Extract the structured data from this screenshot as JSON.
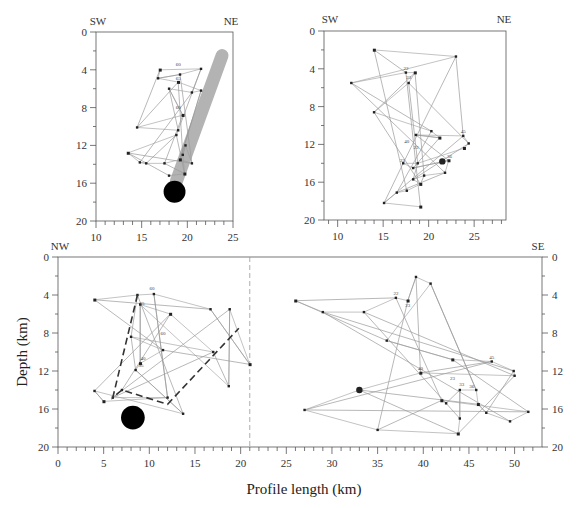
{
  "chart_data": [
    {
      "type": "scatter",
      "panel": "top-left",
      "title": "",
      "direction_labels": {
        "left": "SW",
        "right": "NE"
      },
      "xlim": [
        10,
        25
      ],
      "ylim": [
        20,
        0
      ],
      "xticks": [
        "10",
        "15",
        "20",
        "25"
      ],
      "yticks": [
        "0",
        "4",
        "8",
        "12",
        "16",
        "20"
      ],
      "annotations": [
        "60",
        "65",
        "60"
      ],
      "features": {
        "gray_band": {
          "from": [
            23.8,
            2.5
          ],
          "to": [
            18.8,
            15.8
          ],
          "color": "#b3b3b3"
        },
        "mainshock_circle": {
          "x": 18.6,
          "y": 16.9,
          "radius_km": 1.2,
          "color": "#000000"
        }
      },
      "events_approx": [
        [
          17,
          4
        ],
        [
          21.5,
          3.9
        ],
        [
          19.2,
          4.5
        ],
        [
          16.8,
          4.9
        ],
        [
          19,
          5.3
        ],
        [
          21.5,
          6.2
        ],
        [
          20.5,
          6.4
        ],
        [
          18,
          6
        ],
        [
          19.5,
          8.8
        ],
        [
          14.5,
          10.1
        ],
        [
          19,
          10.4
        ],
        [
          18.8,
          10.9
        ],
        [
          13.5,
          12.8
        ],
        [
          14.8,
          13.8
        ],
        [
          15.5,
          13.9
        ],
        [
          17.5,
          13.9
        ],
        [
          19.2,
          13.5
        ],
        [
          20.5,
          13.9
        ],
        [
          19.8,
          12
        ],
        [
          19.5,
          13
        ],
        [
          19.7,
          15
        ],
        [
          18,
          15.2
        ]
      ]
    },
    {
      "type": "scatter",
      "panel": "top-right",
      "title": "",
      "direction_labels": {
        "left": "SW",
        "right": "NE"
      },
      "xlim": [
        8.5,
        28.5
      ],
      "ylim": [
        20,
        0
      ],
      "xticks": [
        "10",
        "15",
        "20",
        "25"
      ],
      "yticks": [
        "0",
        "4",
        "8",
        "12",
        "16",
        "20"
      ],
      "annotations": [
        "22",
        "23",
        "45",
        "40",
        "23",
        "33",
        "36"
      ],
      "features": {
        "large_dot": {
          "x": 21.5,
          "y": 13.8
        }
      },
      "events_approx": [
        [
          14,
          2
        ],
        [
          23,
          2.7
        ],
        [
          11.5,
          5.5
        ],
        [
          17.5,
          4.4
        ],
        [
          18.5,
          4.4
        ],
        [
          17.8,
          5.5
        ],
        [
          14,
          8.6
        ],
        [
          20.3,
          10.6
        ],
        [
          21.2,
          11.3
        ],
        [
          18.6,
          11
        ],
        [
          23.8,
          11.1
        ],
        [
          24.4,
          11.9
        ],
        [
          23.9,
          12.4
        ],
        [
          18.8,
          14
        ],
        [
          17.2,
          14
        ],
        [
          18.3,
          14.5
        ],
        [
          22.2,
          13.7
        ],
        [
          21.8,
          15
        ],
        [
          19.5,
          15.3
        ],
        [
          18.3,
          15.7
        ],
        [
          19.1,
          16.2
        ],
        [
          17.6,
          16.9
        ],
        [
          16.5,
          17.1
        ],
        [
          15.1,
          18.2
        ],
        [
          19.1,
          18.6
        ]
      ]
    },
    {
      "type": "scatter",
      "panel": "bottom",
      "title": "",
      "xlabel": "Profile length (km)",
      "ylabel": "Depth (km)",
      "direction_labels": {
        "left": "NW",
        "right": "SE"
      },
      "xlim": [
        0,
        53
      ],
      "ylim": [
        20,
        0
      ],
      "xticks": [
        "0",
        "5",
        "10",
        "15",
        "20",
        "25",
        "30",
        "35",
        "40",
        "45",
        "50"
      ],
      "yticks_left": [
        "0",
        "4",
        "8",
        "12",
        "16",
        "20"
      ],
      "yticks_right": [
        "0",
        "4",
        "8",
        "12",
        "16",
        "20"
      ],
      "divider_x": 21,
      "annotations": [
        "60",
        "65",
        "60",
        "40",
        "35",
        "22",
        "23",
        "45",
        "40",
        "23",
        "33",
        "36"
      ],
      "features": {
        "dashed_outline": [
          [
            8.7,
            4
          ],
          [
            6,
            14.8
          ],
          [
            7,
            14
          ],
          [
            12,
            15.5
          ],
          [
            19.8,
            7.5
          ]
        ],
        "mainshock_circle": {
          "x": 8.2,
          "y": 16.9,
          "radius_km": 1.3,
          "color": "#000000"
        },
        "large_dot": {
          "x": 33,
          "y": 14
        }
      },
      "events_left_approx": [
        [
          4,
          4.5
        ],
        [
          8.7,
          4
        ],
        [
          10.5,
          3.9
        ],
        [
          16.7,
          5.5
        ],
        [
          21,
          11.3
        ],
        [
          18.8,
          5.5
        ],
        [
          18.7,
          13.6
        ],
        [
          9,
          5
        ],
        [
          12.3,
          6
        ],
        [
          17,
          10
        ],
        [
          8,
          8.4
        ],
        [
          11.5,
          9.8
        ],
        [
          9,
          11.2
        ],
        [
          8.5,
          11.9
        ],
        [
          13.7,
          16.5
        ],
        [
          4,
          14.1
        ],
        [
          5,
          15.2
        ],
        [
          12,
          14.8
        ],
        [
          6,
          14.8
        ],
        [
          7,
          14
        ]
      ],
      "events_right_approx": [
        [
          26,
          4.6
        ],
        [
          29,
          5.8
        ],
        [
          33.5,
          5.8
        ],
        [
          37,
          4.3
        ],
        [
          38.3,
          4.6
        ],
        [
          39.2,
          2.1
        ],
        [
          40.8,
          2.8
        ],
        [
          36,
          8.8
        ],
        [
          43.2,
          10.8
        ],
        [
          47.5,
          11
        ],
        [
          49.9,
          12
        ],
        [
          50,
          12.5
        ],
        [
          39.7,
          12.2
        ],
        [
          33,
          14
        ],
        [
          27,
          16.1
        ],
        [
          35,
          18.2
        ],
        [
          43.8,
          18.6
        ],
        [
          44,
          17
        ],
        [
          44,
          14
        ],
        [
          45.8,
          14
        ],
        [
          46,
          15.5
        ],
        [
          46.9,
          16.4
        ],
        [
          49.5,
          17.3
        ],
        [
          51.5,
          16.3
        ],
        [
          42,
          15.1
        ],
        [
          42.5,
          15.4
        ]
      ]
    }
  ],
  "figure": {
    "panels": {
      "top_left": {
        "left_label": "SW",
        "right_label": "NE"
      },
      "top_right": {
        "left_label": "SW",
        "right_label": "NE"
      },
      "bottom": {
        "left_label": "NW",
        "right_label": "SE"
      }
    },
    "axis_titles": {
      "y": "Depth (km)",
      "x": "Profile length (km)"
    },
    "colors": {
      "gray_band": "#b3b3b3",
      "event_line": "#9a9a9a",
      "dot": "#222222",
      "dashed": "#333333",
      "axis": "#555555"
    }
  },
  "caption_fragment": "...the epicentral and depth relocation of aftershocks..."
}
